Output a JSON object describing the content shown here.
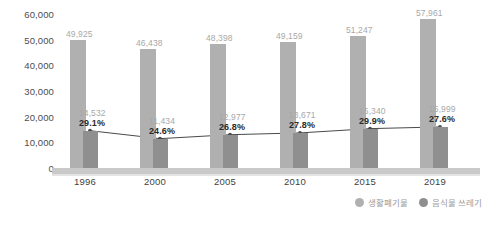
{
  "chart_data": {
    "type": "bar",
    "title": "",
    "subtitle": "",
    "xlabel": "",
    "ylabel": "",
    "ylim": [
      0,
      60000
    ],
    "ygrid": false,
    "legend_position": "bottom-right",
    "categories": [
      "1996",
      "2000",
      "2005",
      "2010",
      "2015",
      "2019"
    ],
    "ytick_labels": [
      "60,000",
      "50,000",
      "40,000",
      "30,000",
      "20,000",
      "10,000",
      "0"
    ],
    "ytick_values": [
      60000,
      50000,
      40000,
      30000,
      20000,
      10000,
      0
    ],
    "series": [
      {
        "name": "생활폐기물",
        "type": "bar",
        "color": "#b0b0b0",
        "values": [
          49925,
          46438,
          48398,
          49159,
          51247,
          57961
        ],
        "labels": [
          "49,925",
          "46,438",
          "48,398",
          "49,159",
          "51,247",
          "57,961"
        ]
      },
      {
        "name": "음식물 쓰레기",
        "type": "bar",
        "color": "#8f8f8f",
        "values": [
          14532,
          11434,
          12977,
          13671,
          15340,
          15999
        ],
        "labels": [
          "14,532",
          "11,434",
          "12,977",
          "13,671",
          "15,340",
          "15,999"
        ]
      },
      {
        "name": "비율",
        "type": "line",
        "color": "#4a4a4a",
        "values": [
          29.1,
          24.6,
          26.8,
          27.8,
          29.9,
          27.6
        ],
        "labels": [
          "29.1%",
          "24.6%",
          "26.8%",
          "27.8%",
          "29.9%",
          "27.6%"
        ]
      }
    ]
  },
  "legend": {
    "items": [
      {
        "label": "생활폐기물",
        "color": "#b0b0b0"
      },
      {
        "label": "음식물 쓰레기",
        "color": "#8f8f8f"
      }
    ]
  },
  "colors": {
    "bar_main": "#b0b0b0",
    "bar_sub": "#8f8f8f",
    "line": "#4a4a4a",
    "baseline": "#c9c9c9",
    "value_label": "#a8a8a8",
    "pct_label": "#2b2b2b",
    "axis_label": "#3f3f3f"
  }
}
